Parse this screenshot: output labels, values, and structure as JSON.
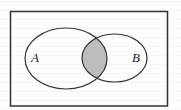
{
  "diagram": {
    "type": "venn",
    "universe": {
      "shape": "rectangle",
      "label": ""
    },
    "sets": [
      {
        "id": "A",
        "label": "A",
        "shaded": false
      },
      {
        "id": "B",
        "label": "B",
        "shaded": false
      }
    ],
    "regions": [
      {
        "name": "A only",
        "shaded": false
      },
      {
        "name": "A ∩ B",
        "shaded": true
      },
      {
        "name": "B only",
        "shaded": false
      },
      {
        "name": "outside A ∪ B",
        "shaded": false
      }
    ],
    "shaded_region": "A ∩ B"
  },
  "colors": {
    "stroke": "#333333",
    "shade": "#bdbdbd",
    "background": "#ffffff"
  }
}
